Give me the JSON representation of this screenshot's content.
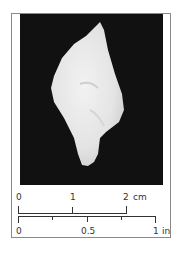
{
  "figure": {
    "background_color": "#111111",
    "specimen_color": "#ececec",
    "frame_color": "#8a8a8a"
  },
  "scale_bar": {
    "metric": {
      "labels": [
        "0",
        "1",
        "2"
      ],
      "unit": "cm"
    },
    "imperial": {
      "labels": [
        "0",
        "0.5",
        "1"
      ],
      "unit": "in"
    }
  }
}
